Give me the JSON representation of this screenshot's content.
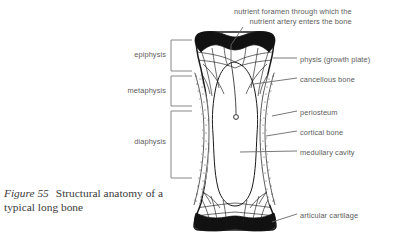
{
  "figure": {
    "number_label": "Figure 55",
    "caption_text": "Structural anatomy of a typical long bone"
  },
  "colors": {
    "ink": "#1a1a1a",
    "label_text": "#5b5b5b",
    "caption_text": "#3a3a3a",
    "leader_line": "#6a6a6a",
    "bracket_line": "#7a7a7a",
    "cartilage_fill": "#111111",
    "cortical_stipple": "#2a2a2a",
    "background": "#ffffff"
  },
  "labels_right": [
    {
      "id": "nutrient-foramen",
      "line1": "nutrient foramen through which the",
      "line2": "nutrient artery enters the bone",
      "x": 234,
      "y": 8
    },
    {
      "id": "physis",
      "text": "physis (growth plate)",
      "x": 300,
      "y": 60
    },
    {
      "id": "cancellous-bone",
      "text": "cancellous bone",
      "x": 300,
      "y": 80
    },
    {
      "id": "periosteum",
      "text": "periosteum",
      "x": 300,
      "y": 113
    },
    {
      "id": "cortical-bone",
      "text": "cortical bone",
      "x": 300,
      "y": 133
    },
    {
      "id": "medullary-cavity",
      "text": "medullary cavity",
      "x": 300,
      "y": 153
    },
    {
      "id": "articular-cartilage",
      "text": "articular cartilage",
      "x": 300,
      "y": 215
    }
  ],
  "labels_left": [
    {
      "id": "epiphysis",
      "text": "epiphysis",
      "right_x": 166,
      "y": 53
    },
    {
      "id": "metaphysis",
      "text": "metaphysis",
      "right_x": 166,
      "y": 89
    },
    {
      "id": "diaphysis",
      "text": "diaphysis",
      "right_x": 166,
      "y": 140
    }
  ],
  "brackets": [
    {
      "id": "epiphysis-bracket",
      "top": 40,
      "bottom": 71,
      "left": 171,
      "right": 192
    },
    {
      "id": "metaphysis-bracket",
      "top": 76,
      "bottom": 106,
      "left": 171,
      "right": 192
    },
    {
      "id": "diaphysis-bracket",
      "top": 111,
      "bottom": 178,
      "left": 171,
      "right": 192
    }
  ]
}
